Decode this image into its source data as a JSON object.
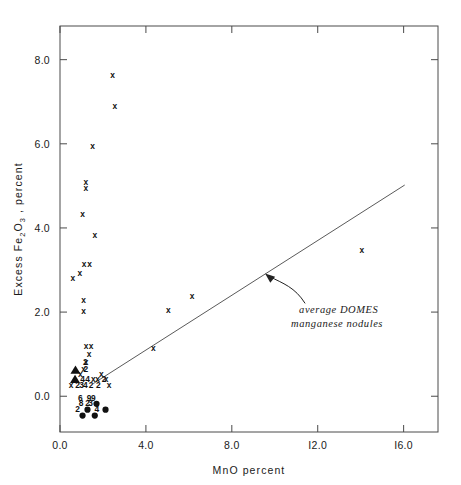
{
  "figure": {
    "background": "#ffffff",
    "ink_color": "#1a1a1a"
  },
  "chart_data": {
    "type": "scatter",
    "title": "",
    "xlabel": "MnO  percent",
    "ylabel": "Excess  Fe2O3 , percent",
    "ylabel_parts": {
      "lead": "Excess  Fe",
      "sub1": "2",
      "mid": "O",
      "sub2": "3",
      "tail": " , percent"
    },
    "xlim": [
      0.0,
      17.6
    ],
    "ylim": [
      -0.85,
      8.8
    ],
    "xticks": [
      0.0,
      4.0,
      8.0,
      12.0,
      16.0
    ],
    "xtick_labels": [
      "0.0",
      "4.0",
      "8.0",
      "I2.0",
      "I6.0"
    ],
    "yticks": [
      0.0,
      2.0,
      4.0,
      6.0,
      8.0
    ],
    "ytick_labels": [
      "0.0",
      "2.0",
      "4.0",
      "6.0",
      "8.0"
    ],
    "grid": false,
    "frame": "full-box-with-inward-ticks",
    "legend": "none",
    "marker_symbols": {
      "cross": "x",
      "triangle": "filled-triangle",
      "circle": "filled-circle",
      "digit": "overlap-count"
    },
    "series": [
      {
        "name": "sediment samples",
        "marker": "x",
        "points": [
          {
            "x": 2.45,
            "y": 7.62
          },
          {
            "x": 2.55,
            "y": 6.88
          },
          {
            "x": 1.52,
            "y": 5.92
          },
          {
            "x": 1.2,
            "y": 5.07
          },
          {
            "x": 1.2,
            "y": 4.93
          },
          {
            "x": 1.05,
            "y": 4.32
          },
          {
            "x": 1.62,
            "y": 3.82
          },
          {
            "x": 1.12,
            "y": 3.12
          },
          {
            "x": 1.38,
            "y": 3.12
          },
          {
            "x": 0.92,
            "y": 2.92
          },
          {
            "x": 0.6,
            "y": 2.78
          },
          {
            "x": 1.1,
            "y": 2.28
          },
          {
            "x": 1.1,
            "y": 2.0
          },
          {
            "x": 6.15,
            "y": 2.36
          },
          {
            "x": 5.05,
            "y": 2.02
          },
          {
            "x": 4.35,
            "y": 1.12
          },
          {
            "x": 14.05,
            "y": 3.45
          },
          {
            "x": 1.22,
            "y": 1.18
          },
          {
            "x": 1.45,
            "y": 1.18
          },
          {
            "x": 1.35,
            "y": 0.98
          },
          {
            "x": 1.22,
            "y": 0.8
          },
          {
            "x": 1.1,
            "y": 0.62
          },
          {
            "x": 0.95,
            "y": 0.52
          },
          {
            "x": 1.92,
            "y": 0.52
          },
          {
            "x": 1.55,
            "y": 0.4
          },
          {
            "x": 1.75,
            "y": 0.4
          },
          {
            "x": 2.15,
            "y": 0.4
          },
          {
            "x": 0.52,
            "y": 0.26
          },
          {
            "x": 2.28,
            "y": 0.26
          }
        ]
      },
      {
        "name": "triangle samples",
        "marker": "filled-triangle",
        "points": [
          {
            "x": 0.72,
            "y": 0.62
          },
          {
            "x": 0.7,
            "y": 0.4
          }
        ]
      },
      {
        "name": "nodule samples",
        "marker": "filled-circle",
        "points": [
          {
            "x": 1.7,
            "y": -0.18
          },
          {
            "x": 1.28,
            "y": -0.32
          },
          {
            "x": 2.12,
            "y": -0.32
          },
          {
            "x": 1.05,
            "y": -0.46
          },
          {
            "x": 1.62,
            "y": -0.46
          }
        ]
      },
      {
        "name": "overlap counts",
        "marker": "digit",
        "points": [
          {
            "x": 1.18,
            "y": 0.8,
            "label": "2"
          },
          {
            "x": 1.2,
            "y": 0.62,
            "label": "2"
          },
          {
            "x": 1.05,
            "y": 0.4,
            "label": "4"
          },
          {
            "x": 1.28,
            "y": 0.4,
            "label": "4"
          },
          {
            "x": 2.05,
            "y": 0.4,
            "label": "2"
          },
          {
            "x": 0.82,
            "y": 0.26,
            "label": "2"
          },
          {
            "x": 1.0,
            "y": 0.26,
            "label": "3"
          },
          {
            "x": 1.18,
            "y": 0.26,
            "label": "4"
          },
          {
            "x": 1.45,
            "y": 0.26,
            "label": "2"
          },
          {
            "x": 1.78,
            "y": 0.26,
            "label": "2"
          },
          {
            "x": 0.95,
            "y": -0.05,
            "label": "6"
          },
          {
            "x": 1.35,
            "y": -0.05,
            "label": "9"
          },
          {
            "x": 1.55,
            "y": -0.05,
            "label": "9"
          },
          {
            "x": 0.98,
            "y": -0.18,
            "label": "8"
          },
          {
            "x": 1.28,
            "y": -0.18,
            "label": "2"
          },
          {
            "x": 1.42,
            "y": -0.18,
            "label": "3"
          },
          {
            "x": 0.82,
            "y": -0.32,
            "label": "2"
          },
          {
            "x": 1.72,
            "y": -0.32,
            "label": "4"
          }
        ]
      }
    ],
    "trendline": {
      "name": "average DOMES manganese nodules",
      "x_start": 1.55,
      "y_start": 0.3,
      "x_end": 16.05,
      "y_end": 5.02
    },
    "annotation": {
      "line1": "average  DOMES",
      "line2": "manganese  nodules",
      "style": "italic",
      "arrow_target_x": 9.55,
      "arrow_target_y": 2.92
    }
  }
}
